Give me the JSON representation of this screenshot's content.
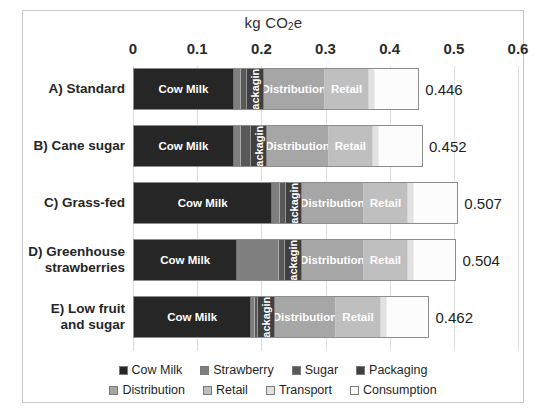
{
  "chart_data": {
    "type": "bar",
    "orientation": "horizontal",
    "stacked": true,
    "title": "kg CO2e",
    "title_main": "kg CO",
    "title_sub": "2",
    "title_tail": "e",
    "xlabel": "kg CO2e",
    "ylabel": "",
    "xlim": [
      0,
      0.6
    ],
    "grid": true,
    "legend_position": "bottom",
    "tick_labels": [
      "0",
      "0.1",
      "0.2",
      "0.3",
      "0.4",
      "0.5",
      "0.6"
    ],
    "tick_values": [
      0,
      0.1,
      0.2,
      0.3,
      0.4,
      0.5,
      0.6
    ],
    "categories": [
      "A) Standard",
      "B) Cane sugar",
      "C) Grass-fed",
      "D) Greenhouse strawberries",
      "E) Low fruit and sugar"
    ],
    "series": [
      {
        "name": "Cow Milk",
        "color": "#262626",
        "values": [
          0.159,
          0.159,
          0.22,
          0.164,
          0.187
        ]
      },
      {
        "name": "Strawberry",
        "color": "#7f7f7f",
        "values": [
          0.01,
          0.01,
          0.01,
          0.066,
          0.004
        ]
      },
      {
        "name": "Sugar",
        "color": "#595959",
        "values": [
          0.008,
          0.014,
          0.008,
          0.008,
          0.004
        ]
      },
      {
        "name": "Packaging",
        "color": "#3f3f3f",
        "values": [
          0.025,
          0.025,
          0.025,
          0.025,
          0.025
        ]
      },
      {
        "name": "Distribution",
        "color": "#a6a6a6",
        "values": [
          0.097,
          0.097,
          0.097,
          0.097,
          0.097
        ]
      },
      {
        "name": "Retail",
        "color": "#bfbfbf",
        "values": [
          0.07,
          0.07,
          0.07,
          0.07,
          0.07
        ]
      },
      {
        "name": "Transport",
        "color": "#e2e2e2",
        "values": [
          0.008,
          0.008,
          0.008,
          0.008,
          0.008
        ]
      },
      {
        "name": "Consumption",
        "color": "#f7f7f7",
        "values": [
          0.069,
          0.069,
          0.069,
          0.066,
          0.067
        ]
      }
    ],
    "totals": [
      "0.446",
      "0.452",
      "0.507",
      "0.504",
      "0.462"
    ],
    "total_values": [
      0.446,
      0.452,
      0.507,
      0.504,
      0.462
    ],
    "segment_inline_labels": {
      "cow_milk": "Cow Milk",
      "packaging": "Packaging",
      "distribution": "Distribution",
      "retail": "Retail"
    }
  },
  "legend": {
    "row1": [
      {
        "label": "Cow Milk",
        "color": "#262626"
      },
      {
        "label": "Strawberry",
        "color": "#7f7f7f"
      },
      {
        "label": "Sugar",
        "color": "#595959"
      },
      {
        "label": "Packaging",
        "color": "#3f3f3f"
      }
    ],
    "row2": [
      {
        "label": "Distribution",
        "color": "#a6a6a6"
      },
      {
        "label": "Retail",
        "color": "#bfbfbf"
      },
      {
        "label": "Transport",
        "color": "#e2e2e2"
      },
      {
        "label": "Consumption",
        "color": "#fdfdfd"
      }
    ]
  }
}
